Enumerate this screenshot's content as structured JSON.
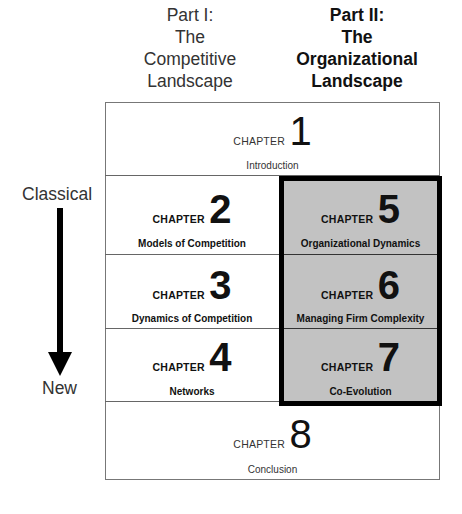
{
  "parts": [
    {
      "lines": [
        "Part I:",
        "The",
        "Competitive",
        "Landscape"
      ],
      "emphasis": "normal"
    },
    {
      "lines": [
        "Part II:",
        "The",
        "Organizational",
        "Landscape"
      ],
      "emphasis": "bold"
    }
  ],
  "timeline": {
    "start_label": "Classical",
    "end_label": "New",
    "arrow_direction": "down"
  },
  "chapter_word": "CHAPTER",
  "chapters": [
    {
      "number": "1",
      "title": "Introduction",
      "part": "both"
    },
    {
      "number": "2",
      "title": "Models of Competition",
      "part": "Part I"
    },
    {
      "number": "3",
      "title": "Dynamics of Competition",
      "part": "Part I"
    },
    {
      "number": "4",
      "title": "Networks",
      "part": "Part I"
    },
    {
      "number": "5",
      "title": "Organizational Dynamics",
      "part": "Part II"
    },
    {
      "number": "6",
      "title": "Managing Firm Complexity",
      "part": "Part II"
    },
    {
      "number": "7",
      "title": "Co-Evolution",
      "part": "Part II"
    },
    {
      "number": "8",
      "title": "Conclusion",
      "part": "both"
    }
  ],
  "colors": {
    "highlight_fill": "#c2c2c2",
    "highlight_border": "#000000",
    "grid_line": "#666666"
  }
}
